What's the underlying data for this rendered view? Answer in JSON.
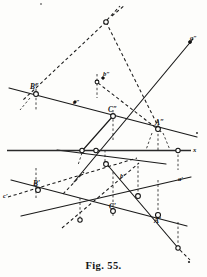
{
  "figure": {
    "caption": "Fig. 55.",
    "title": "Fig. 55.",
    "kind": "descriptive-geometry-line-diagram",
    "width": 207,
    "height": 277,
    "ink_color": "#1a1a1a",
    "paper_color": "#fdfdfb"
  },
  "labels": {
    "ground_axis": "x",
    "top_right_trace": "a″",
    "upper_line_trace": "c″",
    "upper_point_b": "b″",
    "point_B_upper": "B″",
    "point_C_upper": "C″",
    "point_A_upper": "A″",
    "lower_left_trace": "c′",
    "point_B_lower": "B′",
    "point_C_lower": "C′",
    "point_A_lower": "A′",
    "lower_right_trace": "a′",
    "mid_lower_trace": "b′"
  },
  "geometry": {
    "ground_line": {
      "x1": 7,
      "y1": 150.5,
      "x2": 191,
      "y2": 150.5
    },
    "solid_lines": [
      {
        "name": "line-c-upper",
        "x1": 10,
        "y1": 88,
        "x2": 196,
        "y2": 136
      },
      {
        "name": "line-a-upper",
        "x1": 75,
        "y1": 180,
        "x2": 192,
        "y2": 40
      },
      {
        "name": "line-b-upper",
        "x1": 58,
        "y1": 151,
        "x2": 164,
        "y2": 163
      },
      {
        "name": "line-c-lower",
        "x1": 12,
        "y1": 180,
        "x2": 186,
        "y2": 225
      },
      {
        "name": "line-a-lower",
        "x1": 22,
        "y1": 215,
        "x2": 190,
        "y2": 178
      },
      {
        "name": "line-b-lower",
        "x1": 106,
        "y1": 163,
        "x2": 178,
        "y2": 248
      }
    ],
    "dashed_lines": [
      {
        "name": "dash-apex-left",
        "x1": 106,
        "y1": 22,
        "x2": 24,
        "y2": 100
      },
      {
        "name": "dash-apex-right",
        "x1": 106,
        "y1": 22,
        "x2": 160,
        "y2": 131
      },
      {
        "name": "dash-apex-up",
        "x1": 106,
        "y1": 22,
        "x2": 118,
        "y2": 8
      },
      {
        "name": "dash-b-to-apexline",
        "x1": 97,
        "y1": 82,
        "x2": 160,
        "y2": 131
      },
      {
        "name": "dash-lower-long",
        "x1": 8,
        "y1": 196,
        "x2": 136,
        "y2": 158
      },
      {
        "name": "dash-lower-diag",
        "x1": 64,
        "y1": 226,
        "x2": 138,
        "y2": 163
      },
      {
        "name": "dash-a-cont",
        "x1": 66,
        "y1": 191,
        "x2": 86,
        "y2": 171
      }
    ],
    "ordinates": [
      {
        "name": "ord-B",
        "x": 36,
        "y1": 84,
        "y2": 194
      },
      {
        "name": "ord-b",
        "x": 97,
        "y1": 78,
        "y2": 98
      },
      {
        "name": "ord-C",
        "x": 113,
        "y1": 110,
        "y2": 216
      },
      {
        "name": "ord-A",
        "x": 158,
        "y1": 122,
        "y2": 215
      },
      {
        "name": "ord-right",
        "x": 178,
        "y1": 150,
        "y2": 165
      },
      {
        "name": "ord-mid",
        "x": 105,
        "y1": 150,
        "y2": 166
      },
      {
        "name": "ord-low",
        "x": 138,
        "y1": 163,
        "y2": 198
      },
      {
        "name": "ord-end",
        "x": 178,
        "y1": 215,
        "y2": 248
      },
      {
        "name": "ord-B-low",
        "x": 80,
        "y1": 196,
        "y2": 220
      }
    ],
    "nodes_open": [
      {
        "name": "node-apex",
        "cx": 106,
        "cy": 22,
        "r": 2.3
      },
      {
        "name": "node-B-upper",
        "cx": 36,
        "cy": 94,
        "r": 2.4
      },
      {
        "name": "node-b-upper",
        "cx": 97,
        "cy": 82,
        "r": 1.9
      },
      {
        "name": "node-C-upper",
        "cx": 113,
        "cy": 116,
        "r": 2.4
      },
      {
        "name": "node-A-upper",
        "cx": 158,
        "cy": 129,
        "r": 2.4
      },
      {
        "name": "node-axis-left",
        "cx": 82,
        "cy": 150.5,
        "r": 2.2
      },
      {
        "name": "node-axis-mid",
        "cx": 96,
        "cy": 150.5,
        "r": 2.2
      },
      {
        "name": "node-axis-right",
        "cx": 178,
        "cy": 150.5,
        "r": 2.2
      },
      {
        "name": "node-cross-low",
        "cx": 106,
        "cy": 164,
        "r": 2.4
      },
      {
        "name": "node-B-lower",
        "cx": 38,
        "cy": 190,
        "r": 2.4
      },
      {
        "name": "node-trace-mid",
        "cx": 80,
        "cy": 220,
        "r": 2.2
      },
      {
        "name": "node-C-lower",
        "cx": 113,
        "cy": 211,
        "r": 2.4
      },
      {
        "name": "node-a-upper",
        "cx": 138,
        "cy": 196,
        "r": 2.4
      },
      {
        "name": "node-A-lower",
        "cx": 158,
        "cy": 215,
        "r": 2.5
      },
      {
        "name": "node-end-low",
        "cx": 178,
        "cy": 248,
        "r": 2.2
      }
    ],
    "specks": [
      {
        "name": "speck-right-margin",
        "cx": 196,
        "cy": 131,
        "r": 0.9
      },
      {
        "name": "speck-bottom-right",
        "cx": 188,
        "cy": 262,
        "r": 1.0
      },
      {
        "name": "speck-top",
        "cx": 41,
        "cy": 4,
        "r": 0.8
      }
    ]
  }
}
